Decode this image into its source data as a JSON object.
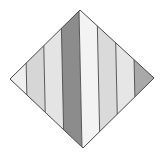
{
  "figure": {
    "shape": "diamond",
    "outline_color": "#4a4a4a",
    "vertices": {
      "top": [
        80,
        10
      ],
      "right": [
        154,
        78
      ],
      "bottom": [
        83,
        148
      ],
      "left": [
        10,
        79
      ]
    },
    "stripe_slant_px": 3,
    "stripe_boundaries_x_at_top": [
      25,
      43,
      61,
      79,
      97,
      115,
      133
    ],
    "stripes": [
      {
        "name": "stripe-1",
        "color": "#efefef"
      },
      {
        "name": "stripe-2",
        "color": "#d6d6d6"
      },
      {
        "name": "stripe-3",
        "color": "#e4e4e4"
      },
      {
        "name": "stripe-4",
        "color": "#8c8c8c"
      },
      {
        "name": "stripe-5",
        "color": "#f3f3f3"
      },
      {
        "name": "stripe-6",
        "color": "#dadada"
      },
      {
        "name": "stripe-7",
        "color": "#e6e6e6"
      },
      {
        "name": "stripe-8",
        "color": "#a9a9a9"
      }
    ]
  }
}
